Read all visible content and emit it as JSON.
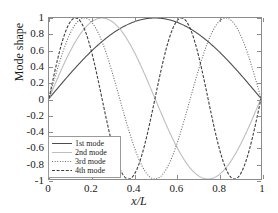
{
  "chart_data": {
    "type": "line",
    "title": "",
    "xlabel": "x/L",
    "ylabel": "Mode shape",
    "xlim": [
      0,
      1
    ],
    "ylim": [
      -1,
      1
    ],
    "grid": false,
    "legend_position": "lower-left",
    "xticks": [
      "0",
      "0.2",
      "0.4",
      "0.6",
      "0.8",
      "1"
    ],
    "xtick_values": [
      0,
      0.2,
      0.4,
      0.6,
      0.8,
      1
    ],
    "yticks": [
      "1",
      "0.8",
      "0.6",
      "0.4",
      "0.2",
      "0",
      "-0.2",
      "-0.4",
      "-0.6",
      "-0.8",
      "-1"
    ],
    "ytick_values": [
      1,
      0.8,
      0.6,
      0.4,
      0.2,
      0,
      -0.2,
      -0.4,
      -0.6,
      -0.8,
      -1
    ],
    "series": [
      {
        "name": "1st mode",
        "formula": "sin(1*pi*x)",
        "harmonic": 1,
        "color": "#4d4d4d",
        "dash": "none",
        "width": 1.1,
        "x": [
          0,
          0.05,
          0.1,
          0.15,
          0.2,
          0.25,
          0.3,
          0.35,
          0.4,
          0.45,
          0.5,
          0.55,
          0.6,
          0.65,
          0.7,
          0.75,
          0.8,
          0.85,
          0.9,
          0.95,
          1
        ],
        "values": [
          0,
          0.156,
          0.309,
          0.454,
          0.588,
          0.707,
          0.809,
          0.891,
          0.951,
          0.988,
          1,
          0.988,
          0.951,
          0.891,
          0.809,
          0.707,
          0.588,
          0.454,
          0.309,
          0.156,
          0
        ]
      },
      {
        "name": "2nd mode",
        "formula": "sin(2*pi*x)",
        "harmonic": 2,
        "color": "#bdbdbd",
        "dash": "none",
        "width": 1.1,
        "x": [
          0,
          0.05,
          0.1,
          0.15,
          0.2,
          0.25,
          0.3,
          0.35,
          0.4,
          0.45,
          0.5,
          0.55,
          0.6,
          0.65,
          0.7,
          0.75,
          0.8,
          0.85,
          0.9,
          0.95,
          1
        ],
        "values": [
          0,
          0.309,
          0.588,
          0.809,
          0.951,
          1,
          0.951,
          0.809,
          0.588,
          0.309,
          0,
          -0.309,
          -0.588,
          -0.809,
          -0.951,
          -1,
          -0.951,
          -0.809,
          -0.588,
          -0.309,
          0
        ]
      },
      {
        "name": "3rd mode",
        "formula": "sin(3*pi*x)",
        "harmonic": 3,
        "color": "#6b6b6b",
        "dash": "1,1.6",
        "width": 1.1,
        "x": [
          0,
          0.05,
          0.1,
          0.15,
          0.2,
          0.25,
          0.3,
          0.35,
          0.4,
          0.45,
          0.5,
          0.55,
          0.6,
          0.65,
          0.7,
          0.75,
          0.8,
          0.85,
          0.9,
          0.95,
          1
        ],
        "values": [
          0,
          0.454,
          0.809,
          0.988,
          0.951,
          0.707,
          0.309,
          -0.156,
          -0.588,
          -0.891,
          -1,
          -0.891,
          -0.588,
          -0.156,
          0.309,
          0.707,
          0.951,
          0.988,
          0.809,
          0.454,
          0
        ]
      },
      {
        "name": "4th mode",
        "formula": "sin(4*pi*x)",
        "harmonic": 4,
        "color": "#3d3d3d",
        "dash": "3,1.6",
        "width": 1.1,
        "x": [
          0,
          0.05,
          0.1,
          0.15,
          0.2,
          0.25,
          0.3,
          0.35,
          0.4,
          0.45,
          0.5,
          0.55,
          0.6,
          0.65,
          0.7,
          0.75,
          0.8,
          0.85,
          0.9,
          0.95,
          1
        ],
        "values": [
          0,
          0.588,
          0.951,
          0.951,
          0.588,
          0,
          -0.588,
          -0.951,
          -0.951,
          -0.588,
          0,
          0.588,
          0.951,
          0.951,
          0.588,
          0,
          -0.588,
          -0.951,
          -0.951,
          -0.588,
          0
        ]
      }
    ]
  },
  "axes": {
    "xlabel": "x/L",
    "ylabel": "Mode shape"
  },
  "legend": {
    "items": [
      {
        "label": "1st mode"
      },
      {
        "label": "2nd mode"
      },
      {
        "label": "3rd mode"
      },
      {
        "label": "4th mode"
      }
    ]
  },
  "style": {
    "frame_color": "#8c8c8c",
    "background": "#ffffff",
    "text_color": "#1a1a1a"
  }
}
